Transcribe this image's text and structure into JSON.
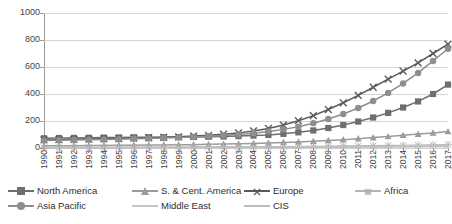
{
  "chart_data": {
    "type": "line",
    "title": "",
    "xlabel": "",
    "ylabel": "",
    "ylim": [
      0,
      1000
    ],
    "yticks": [
      0,
      200,
      400,
      600,
      800,
      1000
    ],
    "grid": true,
    "legend_position": "bottom",
    "x": [
      "1990",
      "1991",
      "1992",
      "1993",
      "1994",
      "1995",
      "1996",
      "1997",
      "1998",
      "1999",
      "2000",
      "2001",
      "2002",
      "2003",
      "2004",
      "2005",
      "2006",
      "2007",
      "2008",
      "2009",
      "2010",
      "2011",
      "2012",
      "2013",
      "2014",
      "2015",
      "2016",
      "2017"
    ],
    "series": [
      {
        "name": "North America",
        "marker": "square",
        "color": "#6e6e6e",
        "values": [
          72,
          74,
          75,
          76,
          77,
          78,
          79,
          80,
          80,
          81,
          82,
          83,
          85,
          88,
          92,
          97,
          105,
          116,
          130,
          148,
          170,
          196,
          226,
          260,
          300,
          345,
          400,
          470
        ]
      },
      {
        "name": "S. & Cent. America",
        "marker": "triangle",
        "color": "#9b9b9b",
        "values": [
          16,
          17,
          17,
          18,
          19,
          20,
          21,
          22,
          23,
          24,
          25,
          27,
          29,
          31,
          34,
          37,
          41,
          45,
          50,
          56,
          62,
          69,
          77,
          85,
          94,
          103,
          112,
          122
        ]
      },
      {
        "name": "Europe",
        "marker": "cross",
        "color": "#5a5a5a",
        "values": [
          60,
          62,
          64,
          66,
          68,
          70,
          73,
          76,
          79,
          83,
          88,
          94,
          102,
          112,
          126,
          145,
          170,
          202,
          240,
          285,
          335,
          390,
          450,
          510,
          570,
          630,
          700,
          770
        ]
      },
      {
        "name": "Africa",
        "marker": "star",
        "color": "#b4b4b4",
        "values": [
          3,
          3,
          3,
          4,
          4,
          4,
          5,
          5,
          5,
          6,
          6,
          7,
          7,
          8,
          8,
          9,
          10,
          11,
          12,
          13,
          14,
          15,
          16,
          18,
          19,
          20,
          22,
          24
        ]
      },
      {
        "name": "Asia Pacific",
        "marker": "circle",
        "color": "#8e8e8e",
        "values": [
          55,
          57,
          59,
          61,
          63,
          65,
          68,
          71,
          74,
          78,
          82,
          87,
          93,
          100,
          110,
          122,
          138,
          158,
          184,
          215,
          252,
          296,
          348,
          408,
          478,
          556,
          645,
          735
        ]
      },
      {
        "name": "Middle East",
        "marker": "line",
        "color": "#c6c6c6",
        "values": [
          2,
          2,
          2,
          2,
          3,
          3,
          3,
          3,
          4,
          4,
          4,
          5,
          5,
          5,
          6,
          6,
          7,
          7,
          8,
          9,
          10,
          11,
          12,
          13,
          15,
          16,
          18,
          20
        ]
      },
      {
        "name": "CIS",
        "marker": "line",
        "color": "#bdbdbd",
        "values": [
          1,
          1,
          1,
          1,
          1,
          2,
          2,
          2,
          2,
          2,
          3,
          3,
          3,
          3,
          4,
          4,
          4,
          5,
          5,
          6,
          6,
          7,
          7,
          8,
          9,
          10,
          11,
          12
        ]
      }
    ]
  }
}
